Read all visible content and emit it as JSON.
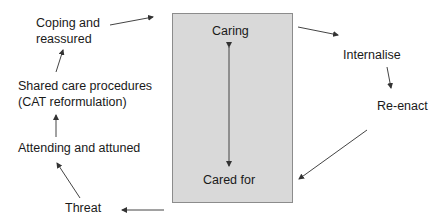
{
  "diagram": {
    "center_box": {
      "top_label": "Caring",
      "bottom_label": "Cared for",
      "fill": "#d9d9d9",
      "border": "#8c8c8c"
    },
    "nodes": [
      {
        "id": "internalise",
        "label": "Internalise"
      },
      {
        "id": "re-enact",
        "label": "Re-enact"
      },
      {
        "id": "threat",
        "label": "Threat"
      },
      {
        "id": "attending",
        "label": "Attending and attuned"
      },
      {
        "id": "shared-care-1",
        "label": "Shared care procedures"
      },
      {
        "id": "shared-care-2",
        "label": "(CAT reformulation)"
      },
      {
        "id": "coping-1",
        "label": "Coping and"
      },
      {
        "id": "coping-2",
        "label": "reassured"
      }
    ],
    "arrow_color": "#333333"
  }
}
